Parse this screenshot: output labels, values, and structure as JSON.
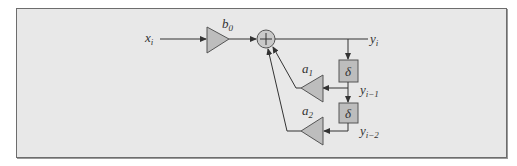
{
  "diagram": {
    "input": {
      "base": "x",
      "sub": "i"
    },
    "output": {
      "base": "y",
      "sub": "i"
    },
    "gains": [
      {
        "id": "b0",
        "base": "b",
        "sub": "0"
      },
      {
        "id": "a1",
        "base": "a",
        "sub": "1"
      },
      {
        "id": "a2",
        "base": "a",
        "sub": "2"
      }
    ],
    "delays": [
      {
        "id": "delay1",
        "symbol": "δ",
        "out_base": "y",
        "out_sub": "i−1"
      },
      {
        "id": "delay2",
        "symbol": "δ",
        "out_base": "y",
        "out_sub": "i−2"
      }
    ],
    "adder_symbol": "+",
    "colors": {
      "frame_bg": "#e8e8e8",
      "block_fill": "#bdbdbd",
      "line": "#333333"
    }
  }
}
